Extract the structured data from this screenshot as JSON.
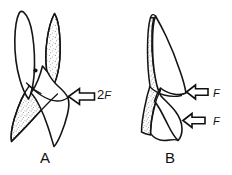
{
  "figure": {
    "background_color": "#ffffff",
    "line_color": "#151515",
    "stipple_color": "#9a9a9a",
    "panels": [
      {
        "id": "A",
        "label": "A",
        "description": "tooth cross-section, two-cusp view, stippled right cusp and stippled lower-left root region, pulp dot at center",
        "force_arrows": [
          {
            "name": "force-arrow-a",
            "label_magnitude": "2",
            "label_symbol": "F",
            "direction": "left",
            "points_at": "crown right side"
          }
        ],
        "markers": [
          {
            "name": "pulp-dot",
            "shape": "dot"
          }
        ]
      },
      {
        "id": "B",
        "label": "B",
        "description": "tooth cross-section, proximal view, stippled left enamel band",
        "force_arrows": [
          {
            "name": "force-arrow-b-upper",
            "label_magnitude": "",
            "label_symbol": "F",
            "direction": "left",
            "points_at": "upper right side"
          },
          {
            "name": "force-arrow-b-lower",
            "label_magnitude": "",
            "label_symbol": "F",
            "direction": "left",
            "points_at": "lower right side"
          }
        ],
        "markers": []
      }
    ]
  }
}
